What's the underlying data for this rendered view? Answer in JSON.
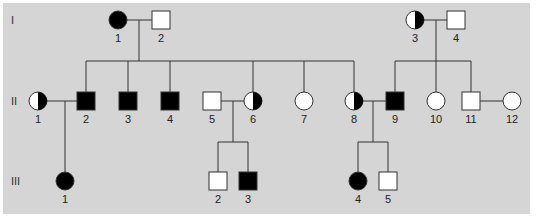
{
  "colors": {
    "background": "#d5d5d5",
    "line": "#333333",
    "affected": "#000000",
    "unaffected": "#ffffff"
  },
  "generations": [
    {
      "label": "I",
      "y": 20
    },
    {
      "label": "II",
      "y": 101
    },
    {
      "label": "III",
      "y": 181
    }
  ],
  "individuals": [
    {
      "id": "I-1",
      "label": "1",
      "sex": "female",
      "status": "affected",
      "x": 118,
      "y": 20
    },
    {
      "id": "I-2",
      "label": "2",
      "sex": "male",
      "status": "unaffected",
      "x": 161,
      "y": 20
    },
    {
      "id": "I-3",
      "label": "3",
      "sex": "female",
      "status": "carrier",
      "x": 415,
      "y": 20
    },
    {
      "id": "I-4",
      "label": "4",
      "sex": "male",
      "status": "unaffected",
      "x": 456,
      "y": 20
    },
    {
      "id": "II-1",
      "label": "1",
      "sex": "female",
      "status": "carrier",
      "x": 38,
      "y": 101
    },
    {
      "id": "II-2",
      "label": "2",
      "sex": "male",
      "status": "affected",
      "x": 86,
      "y": 101
    },
    {
      "id": "II-3",
      "label": "3",
      "sex": "male",
      "status": "affected",
      "x": 128,
      "y": 101
    },
    {
      "id": "II-4",
      "label": "4",
      "sex": "male",
      "status": "affected",
      "x": 170,
      "y": 101
    },
    {
      "id": "II-5",
      "label": "5",
      "sex": "male",
      "status": "unaffected",
      "x": 212,
      "y": 101
    },
    {
      "id": "II-6",
      "label": "6",
      "sex": "female",
      "status": "carrier",
      "x": 253,
      "y": 101
    },
    {
      "id": "II-7",
      "label": "7",
      "sex": "female",
      "status": "unaffected",
      "x": 304,
      "y": 101
    },
    {
      "id": "II-8",
      "label": "8",
      "sex": "female",
      "status": "carrier",
      "x": 354,
      "y": 101
    },
    {
      "id": "II-9",
      "label": "9",
      "sex": "male",
      "status": "affected",
      "x": 395,
      "y": 101
    },
    {
      "id": "II-10",
      "label": "10",
      "sex": "female",
      "status": "unaffected",
      "x": 436,
      "y": 101
    },
    {
      "id": "II-11",
      "label": "11",
      "sex": "male",
      "status": "unaffected",
      "x": 471,
      "y": 101
    },
    {
      "id": "II-12",
      "label": "12",
      "sex": "female",
      "status": "unaffected",
      "x": 512,
      "y": 101
    },
    {
      "id": "III-1",
      "label": "1",
      "sex": "female",
      "status": "affected",
      "x": 65,
      "y": 181
    },
    {
      "id": "III-2",
      "label": "2",
      "sex": "male",
      "status": "unaffected",
      "x": 218,
      "y": 181
    },
    {
      "id": "III-3",
      "label": "3",
      "sex": "male",
      "status": "affected",
      "x": 248,
      "y": 181
    },
    {
      "id": "III-4",
      "label": "4",
      "sex": "female",
      "status": "affected",
      "x": 358,
      "y": 181
    },
    {
      "id": "III-5",
      "label": "5",
      "sex": "male",
      "status": "unaffected",
      "x": 388,
      "y": 181
    }
  ],
  "lines": [
    [
      127,
      20,
      152,
      20
    ],
    [
      139,
      20,
      139,
      61
    ],
    [
      86,
      61,
      354,
      61
    ],
    [
      86,
      61,
      86,
      92
    ],
    [
      128,
      61,
      128,
      92
    ],
    [
      170,
      61,
      170,
      92
    ],
    [
      253,
      61,
      253,
      92
    ],
    [
      304,
      61,
      304,
      92
    ],
    [
      354,
      61,
      354,
      92
    ],
    [
      424,
      20,
      447,
      20
    ],
    [
      436,
      20,
      436,
      92
    ],
    [
      395,
      61,
      471,
      61
    ],
    [
      395,
      61,
      395,
      92
    ],
    [
      471,
      61,
      471,
      92
    ],
    [
      47,
      101,
      77,
      101
    ],
    [
      65,
      101,
      65,
      172
    ],
    [
      221,
      101,
      244,
      101
    ],
    [
      233,
      101,
      233,
      142
    ],
    [
      218,
      142,
      248,
      142
    ],
    [
      218,
      142,
      218,
      172
    ],
    [
      248,
      142,
      248,
      172
    ],
    [
      363,
      101,
      386,
      101
    ],
    [
      373,
      101,
      373,
      142
    ],
    [
      358,
      142,
      388,
      142
    ],
    [
      358,
      142,
      358,
      172
    ],
    [
      388,
      142,
      388,
      172
    ],
    [
      480,
      101,
      503,
      101
    ]
  ]
}
